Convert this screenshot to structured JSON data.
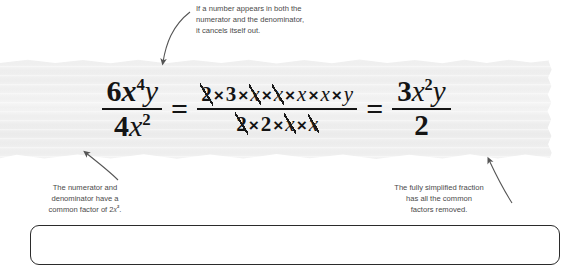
{
  "equation": {
    "left_fraction": {
      "numerator": {
        "coefficient": "6",
        "variable_x": "x",
        "x_exponent": "4",
        "variable_y": "y"
      },
      "denominator": {
        "coefficient": "4",
        "variable_x": "x",
        "x_exponent": "2"
      }
    },
    "equals_sign_1": "=",
    "middle_fraction": {
      "numerator_tokens": [
        "2",
        "3",
        "x",
        "x",
        "x",
        "x",
        "y"
      ],
      "numerator_cancelled": [
        true,
        false,
        true,
        true,
        false,
        false,
        false
      ],
      "denominator_tokens": [
        "2",
        "2",
        "x",
        "x"
      ],
      "denominator_cancelled": [
        true,
        false,
        true,
        true
      ],
      "times_symbol": "×"
    },
    "equals_sign_2": "=",
    "right_fraction": {
      "numerator": {
        "coefficient": "3",
        "variable_x": "x",
        "x_exponent": "2",
        "variable_y": "y"
      },
      "denominator": "2"
    }
  },
  "annotations": {
    "top": {
      "line1": "If a number appears in both the",
      "line2": "numerator and the denominator,",
      "line3": "it cancels itself out."
    },
    "bottom_left": {
      "line1": "The numerator and",
      "line2": "denominator have a",
      "line3_prefix": "common factor of 2",
      "line3_var": "x",
      "line3_exp": "2",
      "line3_suffix": "."
    },
    "bottom_right": {
      "line1": "The fully simplified fraction",
      "line2": "has all the common",
      "line3": "factors removed."
    }
  },
  "colors": {
    "page_background": "#ffffff",
    "paper_strip": "#f1f1f1",
    "equation_text": "#141414",
    "annotation_text": "#4a4a4a",
    "arrow_stroke": "#555555",
    "callout_border": "#2b2b2b"
  }
}
